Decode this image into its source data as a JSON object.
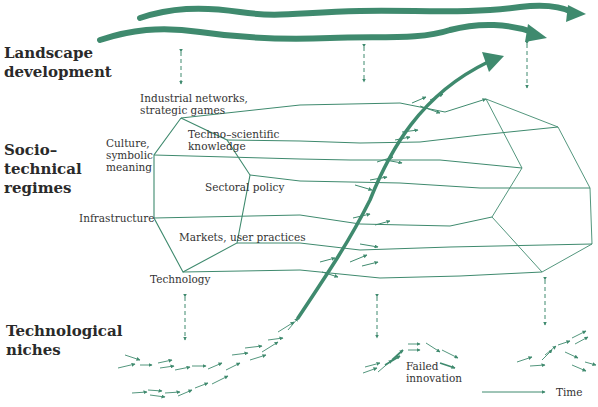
{
  "diagram": {
    "title_hidden": "Multi-level perspective on technological transitions",
    "accent_color": "#3f8a6e",
    "levels": [
      {
        "id": "landscape",
        "line1": "Landscape",
        "line2": "development",
        "line3": ""
      },
      {
        "id": "regime",
        "line1": "Socio–",
        "line2": "technical",
        "line3": "regimes"
      },
      {
        "id": "niche",
        "line1": "Technological",
        "line2": "niches",
        "line3": ""
      }
    ],
    "regime_dimensions": [
      {
        "l1": "Industrial networks,",
        "l2": "strategic games"
      },
      {
        "l1": "Techno–scientific",
        "l2": "knowledge"
      },
      {
        "l1": "Culture,",
        "l2": "symbolic",
        "l3": "meaning"
      },
      {
        "l1": "Sectoral policy"
      },
      {
        "l1": "Infrastructure"
      },
      {
        "l1": "Markets, user practices"
      },
      {
        "l1": "Technology"
      }
    ],
    "annotations": {
      "failed_l1": "Failed",
      "failed_l2": "innovation",
      "time": "Time"
    }
  }
}
